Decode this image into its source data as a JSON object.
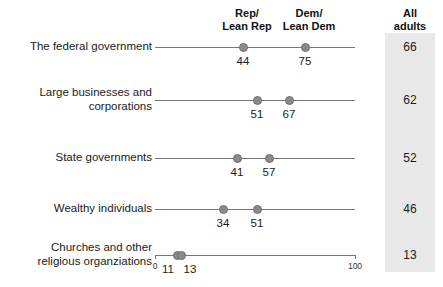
{
  "chart_data": {
    "type": "scatter",
    "title": "",
    "subtitle": "",
    "xlabel": "",
    "ylabel": "",
    "xlim": [
      0,
      100
    ],
    "grid": false,
    "legend_position": "top",
    "orientation": "horizontal",
    "axis_ticks": [
      {
        "value": 0,
        "label": "0"
      },
      {
        "value": 100,
        "label": "100"
      }
    ],
    "column_headers": [
      {
        "id": "rep",
        "lines": [
          "Rep/",
          "Lean Rep"
        ]
      },
      {
        "id": "dem",
        "lines": [
          "Dem/",
          "Lean Dem"
        ]
      },
      {
        "id": "all",
        "lines": [
          "All",
          "adults"
        ]
      }
    ],
    "series": [
      {
        "name": "Rep/Lean Rep",
        "values": [
          44,
          51,
          41,
          34,
          11
        ]
      },
      {
        "name": "Dem/Lean Dem",
        "values": [
          75,
          67,
          57,
          51,
          13
        ]
      },
      {
        "name": "All adults",
        "values": [
          66,
          62,
          52,
          46,
          13
        ]
      }
    ],
    "categories": [
      "The federal government",
      "Large businesses and corporations",
      "State governments",
      "Wealthy individuals",
      "Churches and other religious organziations"
    ],
    "rows": [
      {
        "label_lines": [
          "The federal government"
        ],
        "rep": 44,
        "dem": 75,
        "all": 66,
        "rep_label": "44",
        "dem_label": "75",
        "all_label": "66"
      },
      {
        "label_lines": [
          "Large businesses and",
          "corporations"
        ],
        "rep": 51,
        "dem": 67,
        "all": 62,
        "rep_label": "51",
        "dem_label": "67",
        "all_label": "62"
      },
      {
        "label_lines": [
          "State governments"
        ],
        "rep": 41,
        "dem": 57,
        "all": 52,
        "rep_label": "41",
        "dem_label": "57",
        "all_label": "52"
      },
      {
        "label_lines": [
          "Wealthy individuals"
        ],
        "rep": 34,
        "dem": 51,
        "all": 46,
        "rep_label": "34",
        "dem_label": "51",
        "all_label": "46"
      },
      {
        "label_lines": [
          "Churches and other",
          "religious organziations"
        ],
        "rep": 11,
        "dem": 13,
        "all": 13,
        "rep_label": "11",
        "dem_label": "13",
        "all_label": "13"
      }
    ],
    "colors": {
      "dot": "#8a8a8a",
      "dot_border": "#6f6f6f",
      "axis_line": "#767676",
      "band": "#e8e8e8",
      "text": "#1a1a1a",
      "background": "#ffffff"
    }
  },
  "headers": {
    "rep_line1": "Rep/",
    "rep_line2": "Lean Rep",
    "dem_line1": "Dem/",
    "dem_line2": "Lean Dem",
    "all_line1": "All",
    "all_line2": "adults"
  },
  "axis": {
    "min_label": "0",
    "max_label": "100"
  }
}
